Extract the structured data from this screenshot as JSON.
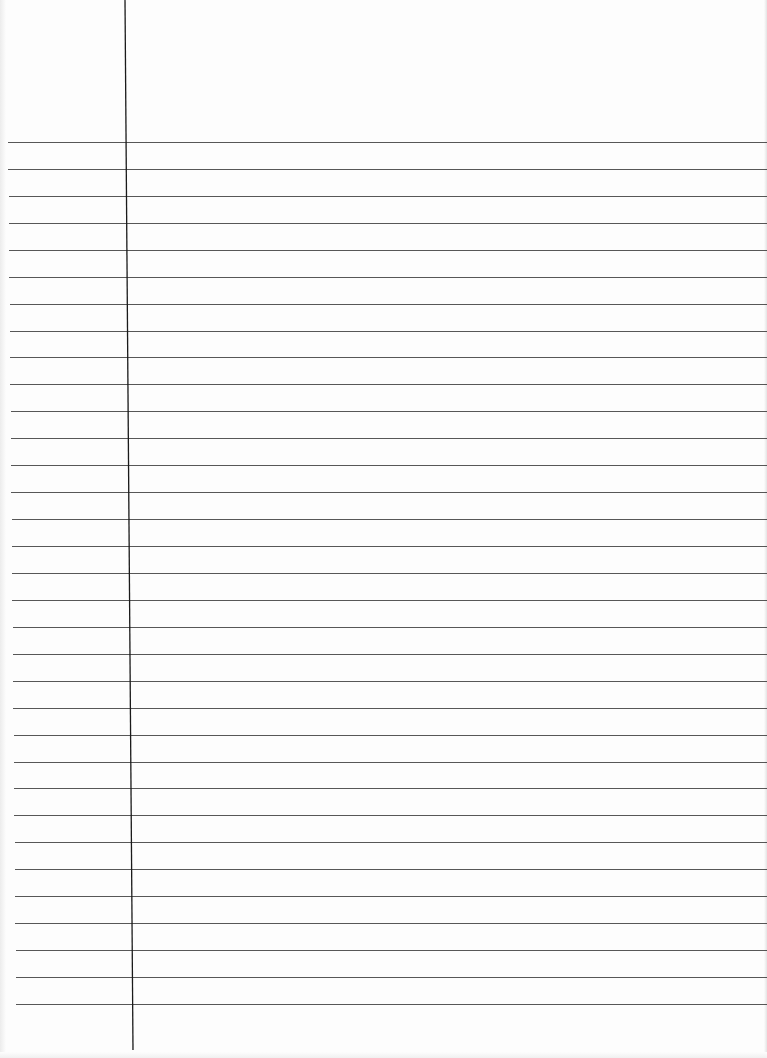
{
  "document": {
    "type": "ruled-notebook-page",
    "content_text": "",
    "ruled_lines": {
      "count": 33,
      "first_y": 142,
      "spacing": 27,
      "color": "#3a3a3a"
    },
    "margin_line": {
      "top_x": 125,
      "bottom_x": 133,
      "top_y": 0,
      "bottom_y": 1050,
      "color": "#1a1a1a"
    },
    "paper_color": "#fdfdfd"
  }
}
